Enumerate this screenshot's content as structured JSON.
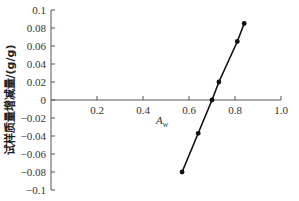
{
  "chart_data": {
    "type": "line",
    "title": "",
    "xlabel": "A_w",
    "xlabel_main": "A",
    "xlabel_sub": "w",
    "ylabel": "试样质量增减量/(g/g)",
    "xlim": [
      0,
      1.0
    ],
    "ylim": [
      -0.1,
      0.1
    ],
    "x_ticks": [
      0.2,
      0.4,
      0.6,
      0.8,
      1.0
    ],
    "x_tick_labels": [
      "0.2",
      "0.4",
      "0.6",
      "0.8",
      "1.0"
    ],
    "y_ticks": [
      0.1,
      0.08,
      0.06,
      0.04,
      0.02,
      0,
      -0.02,
      -0.04,
      -0.06,
      -0.08,
      -0.1
    ],
    "y_tick_labels": [
      "0.1",
      "0.08",
      "0.06",
      "0.04",
      "0.02",
      "0",
      "−0.02",
      "−0.04",
      "−0.06",
      "−0.08",
      "−0.1"
    ],
    "grid": false,
    "legend": null,
    "series": [
      {
        "name": "试样质量增减量",
        "marker": "circle",
        "color": "#111111",
        "x": [
          0.57,
          0.64,
          0.7,
          0.73,
          0.81,
          0.84
        ],
        "y": [
          -0.08,
          -0.037,
          0.0,
          0.02,
          0.065,
          0.085
        ]
      }
    ]
  },
  "layout": {
    "origin_px": [
      51,
      100
    ],
    "x_px_per_unit": 230,
    "y_px_per_unit": 900
  }
}
